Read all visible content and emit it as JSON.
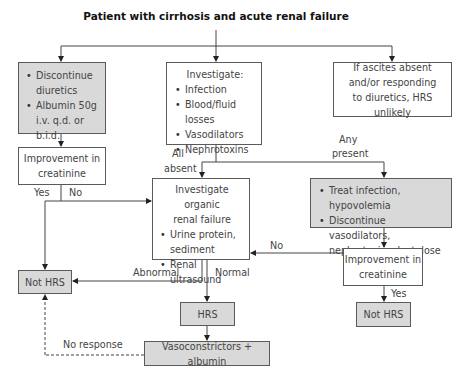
{
  "title": "Patient with cirrhosis and acute renal failure",
  "boxes": {
    "discontinue": {
      "items": [
        "Discontinue diuretics",
        "Albumin 50g i.v. q.d. or b.i.d."
      ]
    },
    "investigate": {
      "heading": "Investigate:",
      "items": [
        "Infection",
        "Blood/fluid losses",
        "Vasodilators",
        "Nephrotoxins"
      ]
    },
    "ascites": {
      "lines": [
        "If ascites absent",
        "and/or responding",
        "to diuretics, HRS unlikely"
      ]
    },
    "improvement_left": {
      "lines": [
        "Improvement in",
        "creatinine"
      ]
    },
    "organic": {
      "heading_lines": [
        "Investigate organic",
        "renal failure"
      ],
      "items": [
        "Urine protein, sediment",
        "Renal ultrasound"
      ]
    },
    "treat": {
      "items": [
        "Treat infection, hypovolemia",
        "Discontinue vasodilators, nephrotoxins, lactulose"
      ]
    },
    "improvement_right": {
      "lines": [
        "Improvement in",
        "creatinine"
      ]
    },
    "not_hrs_left": {
      "label": "Not HRS"
    },
    "not_hrs_right": {
      "label": "Not HRS"
    },
    "hrs": {
      "label": "HRS"
    },
    "vasoconstrictors": {
      "label": "Vasoconstrictors + albumin"
    }
  },
  "edge_labels": {
    "yes_left": "Yes",
    "no_left": "No",
    "all_absent_1": "All",
    "all_absent_2": "absent",
    "any_present_1": "Any",
    "any_present_2": "present",
    "no_right": "No",
    "abnormal": "Abnormal",
    "normal": "Normal",
    "yes_right": "Yes",
    "no_response": "No response"
  },
  "colors": {
    "gray_fill": "#d9d9d9",
    "border": "#5a5a5a",
    "line": "#444444"
  }
}
